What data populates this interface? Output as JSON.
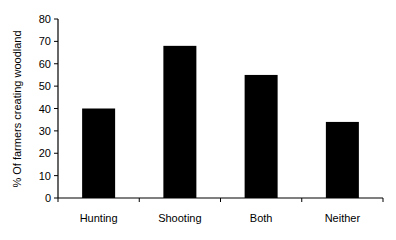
{
  "chart_data": {
    "type": "bar",
    "title": "",
    "xlabel": "",
    "ylabel": "% Of farmers creating woodland",
    "categories": [
      "Hunting",
      "Shooting",
      "Both",
      "Neither"
    ],
    "values": [
      40,
      68,
      55,
      34
    ],
    "ylim": [
      0,
      80
    ],
    "yticks": [
      0,
      10,
      20,
      30,
      40,
      50,
      60,
      70,
      80
    ],
    "grid": false,
    "legend": null,
    "bar_color": "#000000"
  }
}
